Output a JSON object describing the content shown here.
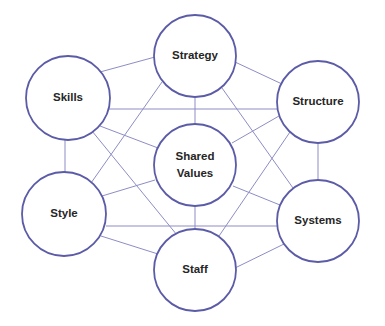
{
  "diagram": {
    "title": "",
    "colors": {
      "node_stroke": "#5b5ba8",
      "edge_stroke": "#8d8dc6",
      "label": "#262626",
      "background": "#ffffff"
    },
    "nodes": [
      {
        "id": "strategy",
        "label": "Strategy",
        "cx": 195,
        "cy": 56,
        "r": 41
      },
      {
        "id": "skills",
        "label": "Skills",
        "cx": 68,
        "cy": 98,
        "r": 42
      },
      {
        "id": "structure",
        "label": "Structure",
        "cx": 318,
        "cy": 102,
        "r": 41
      },
      {
        "id": "shared_values",
        "label": "Shared Values",
        "lines": [
          "Shared",
          "Values"
        ],
        "cx": 195,
        "cy": 165,
        "r": 41
      },
      {
        "id": "style",
        "label": "Style",
        "cx": 64,
        "cy": 214,
        "r": 42
      },
      {
        "id": "systems",
        "label": "Systems",
        "cx": 318,
        "cy": 221,
        "r": 41
      },
      {
        "id": "staff",
        "label": "Staff",
        "cx": 195,
        "cy": 270,
        "r": 41
      }
    ],
    "edges": [
      {
        "from": "skills",
        "to": "strategy",
        "x1": 100,
        "y1": 72,
        "x2": 155,
        "y2": 57
      },
      {
        "from": "strategy",
        "to": "structure",
        "x1": 235,
        "y1": 62,
        "x2": 282,
        "y2": 84
      },
      {
        "from": "strategy",
        "to": "shared_values",
        "x1": 195,
        "y1": 97,
        "x2": 195,
        "y2": 124
      },
      {
        "from": "strategy",
        "to": "style",
        "x1": 162,
        "y1": 82,
        "x2": 91,
        "y2": 183
      },
      {
        "from": "strategy",
        "to": "systems",
        "x1": 222,
        "y1": 88,
        "x2": 293,
        "y2": 188
      },
      {
        "from": "skills",
        "to": "structure",
        "x1": 107,
        "y1": 109,
        "x2": 278,
        "y2": 109
      },
      {
        "from": "skills",
        "to": "shared_values",
        "x1": 100,
        "y1": 126,
        "x2": 158,
        "y2": 148
      },
      {
        "from": "skills",
        "to": "style",
        "x1": 65,
        "y1": 140,
        "x2": 65,
        "y2": 173
      },
      {
        "from": "skills",
        "to": "staff",
        "x1": 92,
        "y1": 131,
        "x2": 177,
        "y2": 235
      },
      {
        "from": "structure",
        "to": "shared_values",
        "x1": 279,
        "y1": 116,
        "x2": 232,
        "y2": 143
      },
      {
        "from": "structure",
        "to": "systems",
        "x1": 318,
        "y1": 143,
        "x2": 318,
        "y2": 180
      },
      {
        "from": "structure",
        "to": "staff",
        "x1": 290,
        "y1": 132,
        "x2": 219,
        "y2": 236
      },
      {
        "from": "shared_values",
        "to": "style",
        "x1": 155,
        "y1": 180,
        "x2": 102,
        "y2": 196
      },
      {
        "from": "shared_values",
        "to": "systems",
        "x1": 233,
        "y1": 186,
        "x2": 280,
        "y2": 205
      },
      {
        "from": "shared_values",
        "to": "staff",
        "x1": 195,
        "y1": 206,
        "x2": 195,
        "y2": 230
      },
      {
        "from": "style",
        "to": "systems",
        "x1": 106,
        "y1": 226,
        "x2": 279,
        "y2": 226
      },
      {
        "from": "style",
        "to": "staff",
        "x1": 101,
        "y1": 236,
        "x2": 158,
        "y2": 254
      },
      {
        "from": "staff",
        "to": "systems",
        "x1": 235,
        "y1": 268,
        "x2": 284,
        "y2": 244
      }
    ]
  }
}
